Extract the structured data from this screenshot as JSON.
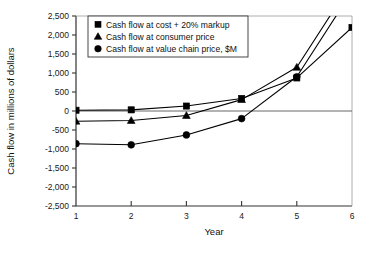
{
  "chart_data": {
    "type": "line",
    "title": "",
    "xlabel": "Year",
    "ylabel": "Cash flow in millions of dollars",
    "x": [
      1,
      2,
      3,
      4,
      5,
      6
    ],
    "xticklabels": [
      "1",
      "2",
      "3",
      "4",
      "5",
      "6"
    ],
    "xlim": [
      1,
      6
    ],
    "ylim": [
      -2500,
      2500
    ],
    "yticks": [
      2500,
      2000,
      1500,
      1000,
      500,
      0,
      -500,
      -1000,
      -1500,
      -2000,
      -2500
    ],
    "yticklabels": [
      "2,500",
      "2,000",
      "1,500",
      "1,000",
      "500",
      "0",
      "-500",
      "-1,000",
      "-1,500",
      "-2,000",
      "-2,500"
    ],
    "grid": false,
    "zero_line": true,
    "legend_position": "upper-left-inside",
    "series": [
      {
        "name": "Cash flow at cost + 20% markup",
        "marker": "square",
        "values": [
          20,
          30,
          130,
          330,
          870,
          2200
        ]
      },
      {
        "name": "Cash flow at consumer price",
        "marker": "triangle",
        "values": [
          -270,
          -250,
          -120,
          300,
          1150,
          3400
        ]
      },
      {
        "name": "Cash flow at value chain price, $M",
        "marker": "circle",
        "values": [
          -860,
          -890,
          -630,
          -200,
          900,
          3150
        ]
      }
    ]
  },
  "legend": {
    "items": [
      {
        "label": "Cash flow at cost + 20% markup",
        "marker": "square"
      },
      {
        "label": "Cash flow at consumer price",
        "marker": "triangle"
      },
      {
        "label": "Cash flow at value chain price, $M",
        "marker": "circle"
      }
    ]
  },
  "colors": {
    "line": "#000000",
    "marker": "#000000",
    "axis": "#333333",
    "background": "#ffffff"
  }
}
